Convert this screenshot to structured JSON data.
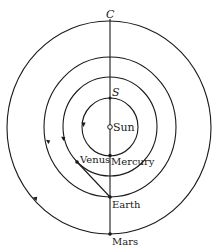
{
  "diagram": {
    "center_label": "Sun",
    "top_label": "C",
    "inner_top_label": "S",
    "planets": [
      {
        "name": "Mercury"
      },
      {
        "name": "Venus"
      },
      {
        "name": "Earth"
      },
      {
        "name": "Mars"
      }
    ],
    "orbit_direction": "counterclockwise (arrows pointing downward on the left side)"
  }
}
